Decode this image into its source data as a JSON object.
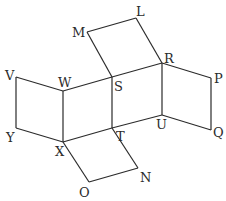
{
  "diagram": {
    "type": "solid-net",
    "stroke_color": "#2b2b2b",
    "background": "#ffffff",
    "vertices": {
      "M": [
        87,
        32
      ],
      "L": [
        136,
        18
      ],
      "V": [
        16,
        77
      ],
      "W": [
        63,
        91
      ],
      "S": [
        112,
        77
      ],
      "R": [
        162,
        63
      ],
      "P": [
        211,
        78
      ],
      "Y": [
        16,
        128
      ],
      "X": [
        63,
        142
      ],
      "T": [
        112,
        128
      ],
      "U": [
        162,
        115
      ],
      "Q": [
        211,
        130
      ],
      "O": [
        89,
        182
      ],
      "N": [
        138,
        168
      ]
    },
    "labels": {
      "M": "M",
      "L": "L",
      "V": "V",
      "W": "W",
      "S": "S",
      "R": "R",
      "P": "P",
      "Y": "Y",
      "X": "X",
      "T": "T",
      "U": "U",
      "Q": "Q",
      "O": "O",
      "N": "N"
    },
    "faces": [
      [
        "M",
        "L",
        "R",
        "S"
      ],
      [
        "V",
        "W",
        "X",
        "Y"
      ],
      [
        "W",
        "S",
        "T",
        "X"
      ],
      [
        "S",
        "R",
        "U",
        "T"
      ],
      [
        "R",
        "P",
        "Q",
        "U"
      ],
      [
        "X",
        "T",
        "N",
        "O"
      ]
    ]
  }
}
